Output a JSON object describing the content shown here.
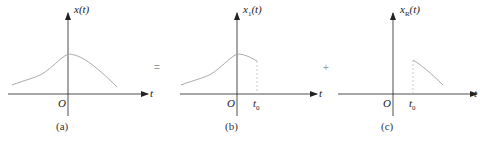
{
  "figure": {
    "panels": [
      {
        "id": "a",
        "ylabel": "x(t)",
        "ylabel_base": "x",
        "ylabel_sub": "",
        "ylabel_arg": "(t)",
        "xlabel": "t",
        "origin": "O",
        "caption": "(a)"
      },
      {
        "id": "b",
        "ylabel": "x1(t)",
        "ylabel_base": "x",
        "ylabel_sub": "1",
        "ylabel_arg": "(t)",
        "xlabel": "t",
        "origin": "O",
        "t0_label": "t",
        "t0_sub": "0",
        "caption": "(b)"
      },
      {
        "id": "c",
        "ylabel": "xR(t)",
        "ylabel_base": "x",
        "ylabel_sub": "R",
        "ylabel_arg": "(t)",
        "xlabel": "t",
        "origin": "O",
        "t0_label": "t",
        "t0_sub": "0",
        "caption": "(c)"
      }
    ],
    "operators": [
      "=",
      "+"
    ],
    "colors": {
      "axis": "#222222",
      "curve": "#aaaaaa",
      "dashed": "#bbbbbb"
    }
  }
}
